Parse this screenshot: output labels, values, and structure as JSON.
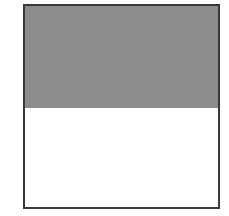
{
  "diagram": {
    "shape": "square",
    "parts": [
      {
        "name": "shaded-region",
        "fraction": 0.5,
        "color": "#8c8c8c"
      },
      {
        "name": "unshaded-region",
        "fraction": 0.5,
        "color": "#ffffff"
      }
    ],
    "stroke_color": "#3a3a3a"
  }
}
